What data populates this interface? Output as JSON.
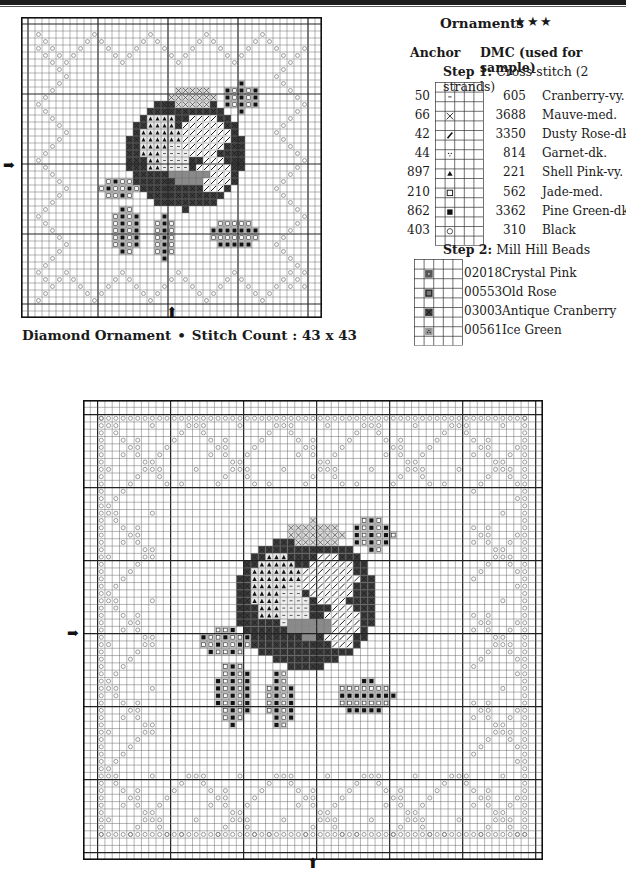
{
  "page": {
    "header_band": true
  },
  "legend": {
    "title": "Ornaments",
    "difficulty_stars": "★★★",
    "header_anchor": "Anchor",
    "header_dmc": "DMC (used for sample)",
    "step1_label": "Step 1:",
    "step1_text": " Cross-stitch (2 strands)",
    "step2_label": "Step 2:",
    "step2_text": " Mill Hill Beads",
    "threads": [
      {
        "anchor": "50",
        "symbol": "dash",
        "dmc": "605",
        "name": "Cranberry-vy. lt."
      },
      {
        "anchor": "66",
        "symbol": "x",
        "dmc": "3688",
        "name": "Mauve-med."
      },
      {
        "anchor": "42",
        "symbol": "slash",
        "dmc": "3350",
        "name": "Dusty Rose-dk."
      },
      {
        "anchor": "44",
        "symbol": "dots",
        "dmc": "814",
        "name": "Garnet-dk."
      },
      {
        "anchor": "897",
        "symbol": "triangle",
        "dmc": "221",
        "name": "Shell Pink-vy. dk."
      },
      {
        "anchor": "210",
        "symbol": "open-square",
        "dmc": "562",
        "name": "Jade-med."
      },
      {
        "anchor": "862",
        "symbol": "filled-square",
        "dmc": "3362",
        "name": "Pine Green-dk."
      },
      {
        "anchor": "403",
        "symbol": "circle",
        "dmc": "310",
        "name": "Black"
      }
    ],
    "beads": [
      {
        "code": "02018",
        "symbol": "bead-dot",
        "name": "Crystal Pink"
      },
      {
        "code": "00553",
        "symbol": "bead-square",
        "name": "Old Rose"
      },
      {
        "code": "03003",
        "symbol": "bead-x",
        "name": "Antique Cranberry"
      },
      {
        "code": "00561",
        "symbol": "bead-dots",
        "name": "Ice Green"
      }
    ]
  },
  "chart1": {
    "caption_name": "Diamond Ornament",
    "caption_sep": "•",
    "caption_count_label": "Stitch Count : 43 x 43",
    "cols": 43,
    "rows": 43,
    "arrow_left": "➡",
    "arrow_bottom": "⬆"
  },
  "chart2": {
    "caption": "",
    "cols": 63,
    "rows": 63,
    "arrow_left": "➡",
    "arrow_bottom": "⬆"
  },
  "colors": {
    "grid_line": "#6b6b6b",
    "grid_major": "#222222",
    "dark_fill": "#3a3a3a",
    "mid_fill": "#8a8a8a",
    "light_fill": "#c8c8c8",
    "symbol": "#555555"
  }
}
